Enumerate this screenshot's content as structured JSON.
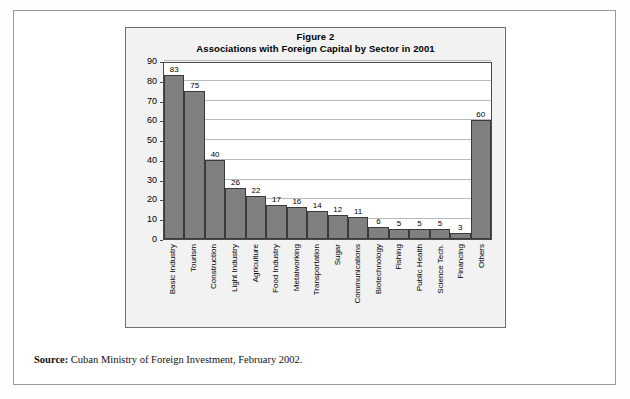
{
  "document": {
    "source_prefix": "Source:",
    "source_text": "Cuban Ministry of Foreign Investment, February 2002."
  },
  "chart_data": {
    "type": "bar",
    "title": "Figure 2",
    "subtitle": "Associations with Foreign Capital by Sector in 2001",
    "xlabel": "",
    "ylabel": "",
    "ylim": [
      0,
      90
    ],
    "ytick_step": 10,
    "yticks": [
      0,
      10,
      20,
      30,
      40,
      50,
      60,
      70,
      80,
      90
    ],
    "grid": true,
    "legend": false,
    "bar_color": "#808080",
    "bar_border_color": "#3a3a3a",
    "plot_background": "#ffffff",
    "chart_background": "#f2f2f2",
    "categories": [
      "Basic Industry",
      "Tourism",
      "Construction",
      "Light Industry",
      "Agriculture",
      "Food Industry",
      "Metalworking",
      "Transportation",
      "Sugar",
      "Communications",
      "Biotechnology",
      "Fishing",
      "Public Health",
      "Science Tech.",
      "Financing",
      "Others"
    ],
    "values": [
      83,
      75,
      40,
      26,
      22,
      17,
      16,
      14,
      12,
      11,
      6,
      5,
      5,
      5,
      3,
      60
    ],
    "data_labels": [
      "83",
      "75",
      "40",
      "26",
      "22",
      "17",
      "16",
      "14",
      "12",
      "11",
      "6",
      "5",
      "5",
      "5",
      "3",
      "60"
    ]
  }
}
